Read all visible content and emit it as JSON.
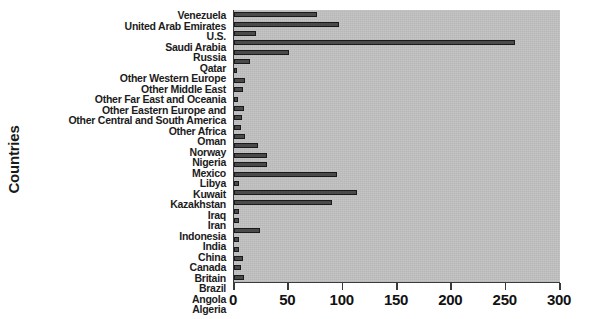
{
  "chart_data": {
    "type": "bar",
    "orientation": "horizontal",
    "title": "",
    "xlabel": "",
    "ylabel": "Countries",
    "xlim": [
      0,
      300
    ],
    "ylim": null,
    "grid": false,
    "legend": null,
    "xticks": [
      0,
      50,
      100,
      150,
      200,
      250,
      300
    ],
    "xticklabels": [
      "0",
      "50",
      "100",
      "150",
      "200",
      "250",
      "300"
    ],
    "categories": [
      "Venezuela",
      "United Arab Emirates",
      "U.S.",
      "Saudi Arabia",
      "Russia",
      "Qatar",
      "Other Western Europe",
      "Other Middle East",
      "Other Far East and Oceania",
      "Other Eastern Europe and",
      "Other Central and South America",
      "Other Africa",
      "Oman",
      "Norway",
      "Nigeria",
      "Mexico",
      "Libya",
      "Kuwait",
      "Kazakhstan",
      "Iraq",
      "Iran",
      "Indonesia",
      "India",
      "China",
      "Canada",
      "Britain",
      "Brazil",
      "Angola",
      "Algeria"
    ],
    "values": [
      76,
      97,
      20,
      259,
      51,
      15,
      3,
      10,
      8,
      4,
      9,
      7,
      6,
      10,
      22,
      30,
      30,
      95,
      5,
      113,
      90,
      5,
      5,
      24,
      5,
      5,
      8,
      6,
      9
    ],
    "colors": {
      "bar_fill": "#4a4a4a",
      "bar_edge": "#1a1a1a",
      "plot_background": "#c2c2c2",
      "figure_background": "#ffffff",
      "axis": "#3a3a3a",
      "text": "#1a1a1a"
    }
  }
}
